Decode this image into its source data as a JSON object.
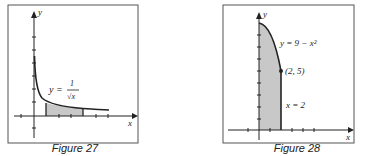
{
  "figures": [
    {
      "caption": "Figure 27",
      "equation_lhs": "y =",
      "equation_num": "1",
      "equation_den": "√x",
      "x_label": "x",
      "y_label": "y"
    },
    {
      "caption": "Figure 28",
      "equation": "y = 9 − x²",
      "point_label": "(2, 5)",
      "line_label": "x = 2",
      "x_label": "x",
      "y_label": "y"
    }
  ],
  "colors": {
    "stroke": "#222222",
    "shade": "#c8c8c8",
    "frame": "#555555"
  }
}
